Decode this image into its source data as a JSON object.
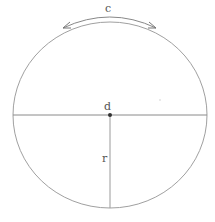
{
  "diagram": {
    "labels": {
      "circumference": "c",
      "diameter": "d",
      "radius": "r"
    },
    "colors": {
      "stroke": "#9a9a9a",
      "arrow": "#777777",
      "center_point": "#333333",
      "text": "#555555"
    },
    "circle": {
      "cx": 110,
      "cy": 115,
      "rx": 97,
      "ry": 93
    }
  }
}
